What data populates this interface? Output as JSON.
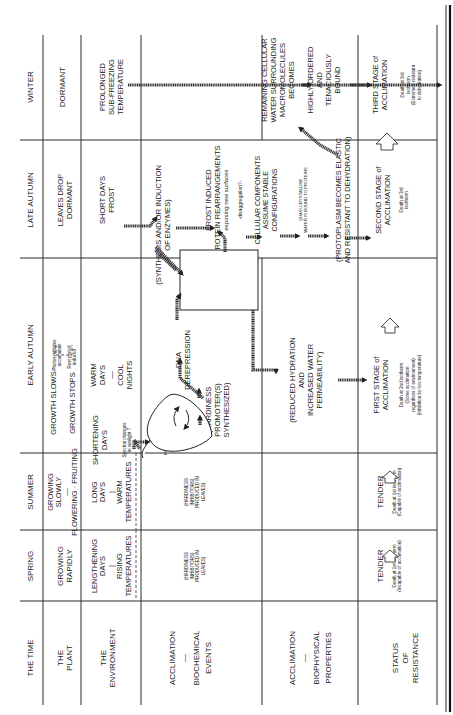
{
  "figure": {
    "orientation": "rotated-90-ccw",
    "row_headers": {
      "time": "THE TIME",
      "plant": [
        "THE",
        "PLANT"
      ],
      "environment": [
        "THE",
        "ENVIRONMENT"
      ],
      "biochemical": [
        "ACCLIMATION",
        "—",
        "BIOCHEMICAL",
        "EVENTS"
      ],
      "biophysical": [
        "ACCLIMATION",
        "—",
        "BIOPHYSICAL",
        "PROPERTIES"
      ],
      "status": [
        "STATUS",
        "OF",
        "RESISTANCE"
      ]
    },
    "seasons": {
      "spring": "SPRING",
      "summer": "SUMMER",
      "early_autumn": "EARLY AUTUMN",
      "late_autumn": "LATE AUTUMN",
      "winter": "WINTER"
    },
    "plant": {
      "spring": [
        "GROWING",
        "RAPIDLY"
      ],
      "summer": [
        "GROWING",
        "SLOWLY",
        "—",
        "FLOWERING · FRUITING"
      ],
      "early_autumn": {
        "slows": "GROWTH SLOWS",
        "slows_note": [
          "Photosynthates",
          "accumulate"
        ],
        "stops": "GROWTH STOPS",
        "stops_note": [
          "Rest period",
          "induced"
        ]
      },
      "late_autumn": [
        "LEAVES DROP",
        "DORMANT"
      ],
      "winter": "DORMANT"
    },
    "environment": {
      "spring": [
        "LENGTHENING",
        "DAYS",
        "|",
        "RISING",
        "TEMPERATURES"
      ],
      "summer": [
        "LONG",
        "DAYS",
        "|",
        "WARM",
        "TEMPERATURES"
      ],
      "early_autumn_a": [
        "SHORTENING",
        "DAYS"
      ],
      "early_autumn_note": [
        "Spectral changes",
        "in sunlight ?"
      ],
      "early_autumn_b": [
        "WARM",
        "DAYS",
        "—",
        "COOL",
        "NIGHTS"
      ],
      "late_autumn": [
        "SHORT DAYS",
        "FROST"
      ],
      "winter": [
        "PROLONGED",
        "SUB-FREEZING",
        "TEMPERATURE"
      ]
    },
    "biochemical": {
      "spring": [
        "(HARDINESS",
        "INHIBITORS)",
        "PRODUCED IN",
        "LEAVES)"
      ],
      "summer": [
        "(HARDINESS",
        "INHIBITORS)",
        "PRODUCED IN",
        "LEAVES)"
      ],
      "phytochrome": "PHYTOCHROME",
      "pfr": "P",
      "pfr_sub": "FR",
      "pr": "P",
      "pr_sub": "R",
      "promoters": [
        "(HARDINESS",
        "PROMOTER(S)",
        "SYNTHESIZED)"
      ],
      "dna": [
        "DNA",
        "DEREPRESSION"
      ],
      "enzymes": [
        "(SYNTHESIS AND/OR INDUCTION",
        "OF ENZYMES)"
      ],
      "frost": [
        "FROST INDUCED",
        "PROTEIN REARRANGEMENTS"
      ],
      "frost_note": "exposing new surfaces",
      "disaggregation": "-disaggregation?-",
      "cellular": [
        "CELLULAR COMPONENTS",
        "ASSUME STABLE",
        "CONFIGURATIONS"
      ],
      "quasi": [
        "QUASI-CRYSTALLINE",
        "WATER IS BOUND TO PROTEINS"
      ],
      "remaining": [
        "REMAINING CELLULAR",
        "WATER SURROUNDING",
        "MACROMOLECULES",
        "BECOMES"
      ],
      "ordered": [
        "HIGHLY ORDERED",
        "AND",
        "TENACIOUSLY",
        "BOUND"
      ]
    },
    "metabolic_box": [
      "(ACTIVE",
      "METABOLIC",
      "CHANGES)",
      "ALTERED",
      "STRUCTURAL",
      "PROTEINS",
      "AND",
      "MEMBRANES"
    ],
    "biophysical": {
      "hydration": [
        "(REDUCED HYDRATION",
        "AND",
        "INCREASED WATER",
        "PERMEABILITY)"
      ],
      "protoplasm": [
        "(PROTOPLASM BECOMES ELASTIC",
        "AND RESISTANT TO DEHYDRATION)"
      ]
    },
    "status": {
      "spring": {
        "label": "TENDER",
        "note": [
          "Death at 1st isotherm",
          "(Incapable of acclimation)"
        ]
      },
      "summer": {
        "label": "TENDER",
        "note": [
          "Death at 1st isotherm",
          "(Capable of acclimation)"
        ]
      },
      "early_autumn": {
        "label": [
          "FIRST STAGE of",
          "ACCLIMATION"
        ],
        "note": [
          "Death at 2nd isotherm",
          "(Some acclimation",
          "regardless of environment)",
          "(Inhibition by low temperature)"
        ]
      },
      "late_autumn": {
        "label": [
          "SECOND STAGE of",
          "ACCLIMATION"
        ],
        "note": [
          "Death at 3rd",
          "isotherm"
        ]
      },
      "winter": {
        "label": [
          "THIRD STAGE of",
          "ACCLIMATION"
        ],
        "note": [
          "Death at 3rd",
          "isotherm",
          "(Extremely resistant",
          "to dehydration)"
        ]
      }
    }
  }
}
